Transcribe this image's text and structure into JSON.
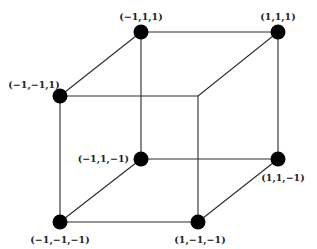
{
  "diagram": {
    "type": "cube",
    "colors": {
      "edge": "#2a2a2a",
      "vertex": "#000000",
      "label": "#222222",
      "background": "#ffffff"
    },
    "vertices": [
      {
        "id": "v_m1_1_1",
        "label": "(−1,1,1)",
        "x": 141,
        "y": 32,
        "dot": true
      },
      {
        "id": "v_1_1_1",
        "label": "(1,1,1)",
        "x": 278,
        "y": 32,
        "dot": true
      },
      {
        "id": "v_m1_m1_1",
        "label": "(−1,−1,1)",
        "x": 60,
        "y": 96,
        "dot": true
      },
      {
        "id": "v_1_m1_1",
        "label": "",
        "x": 198,
        "y": 96,
        "dot": false
      },
      {
        "id": "v_m1_1_m1",
        "label": "(−1,1,−1)",
        "x": 141,
        "y": 159,
        "dot": true
      },
      {
        "id": "v_1_1_m1",
        "label": "(1,1,−1)",
        "x": 278,
        "y": 159,
        "dot": true
      },
      {
        "id": "v_m1_m1_m1",
        "label": "(−1,−1,−1)",
        "x": 60,
        "y": 222,
        "dot": true
      },
      {
        "id": "v_1_m1_m1",
        "label": "(1,−1,−1)",
        "x": 198,
        "y": 222,
        "dot": true
      }
    ],
    "edges": [
      [
        "v_m1_1_1",
        "v_1_1_1"
      ],
      [
        "v_m1_1_1",
        "v_m1_m1_1"
      ],
      [
        "v_m1_1_1",
        "v_m1_1_m1"
      ],
      [
        "v_1_1_1",
        "v_1_m1_1"
      ],
      [
        "v_1_1_1",
        "v_1_1_m1"
      ],
      [
        "v_m1_m1_1",
        "v_1_m1_1"
      ],
      [
        "v_m1_m1_1",
        "v_m1_m1_m1"
      ],
      [
        "v_1_m1_1",
        "v_1_m1_m1"
      ],
      [
        "v_m1_1_m1",
        "v_1_1_m1"
      ],
      [
        "v_m1_1_m1",
        "v_m1_m1_m1"
      ],
      [
        "v_1_1_m1",
        "v_1_m1_m1"
      ],
      [
        "v_m1_m1_m1",
        "v_1_m1_m1"
      ]
    ],
    "labels": {
      "v_m1_1_1": {
        "text": "(−1,1,1)",
        "x": 141,
        "y": 20,
        "anchor": "middle"
      },
      "v_1_1_1": {
        "text": "(1,1,1)",
        "x": 278,
        "y": 20,
        "anchor": "middle"
      },
      "v_m1_m1_1": {
        "text": "(−1,−1,1)",
        "x": 34,
        "y": 88,
        "anchor": "middle"
      },
      "v_m1_1_m1": {
        "text": "(−1,1,−1)",
        "x": 129,
        "y": 162,
        "anchor": "end"
      },
      "v_1_1_m1": {
        "text": "(1,1,−1)",
        "x": 283,
        "y": 181,
        "anchor": "middle"
      },
      "v_m1_m1_m1": {
        "text": "(−1,−1,−1)",
        "x": 60,
        "y": 243,
        "anchor": "middle"
      },
      "v_1_m1_m1": {
        "text": "(1,−1,−1)",
        "x": 200,
        "y": 243,
        "anchor": "middle"
      }
    }
  }
}
